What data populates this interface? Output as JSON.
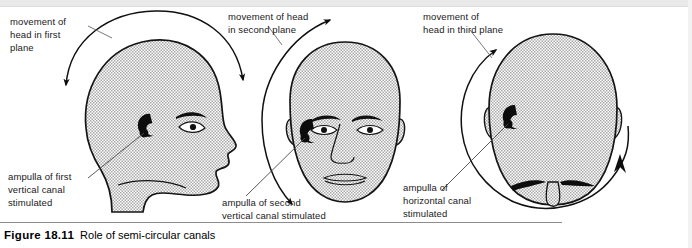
{
  "figure": {
    "number_label": "Figure 18.11",
    "caption_text": "Role of semi-circular canals",
    "panels": [
      {
        "id": "panel-first-plane",
        "view": "lateral-profile-head",
        "movement_label": "movement of\nhead in first\nplane",
        "ampulla_label": "ampulla of first\nvertical canal\nstimulated",
        "arrow_type": "double-headed-arc-over-top",
        "canal_symbol": "c-shaped-ampulla"
      },
      {
        "id": "panel-second-plane",
        "view": "frontal-head",
        "movement_label": "movement of head\nin second plane",
        "ampulla_label": "ampulla of second\nvertical canal stimulated",
        "arrow_type": "double-headed-arc-left-side",
        "canal_symbol": "c-shaped-ampulla"
      },
      {
        "id": "panel-third-plane",
        "view": "superior-top-of-head",
        "movement_label": "movement of\nhead in third plane",
        "ampulla_label": "ampulla of\nhorizontal canal\nstimulated",
        "arrow_type": "double-headed-arc-encircling",
        "canal_symbol": "c-shaped-ampulla"
      }
    ]
  },
  "colors": {
    "head_fill": "#d2d2d2",
    "outline": "#1a1a1a",
    "ink": "#000000",
    "page": "#ffffff",
    "rule": "#8d8d8d",
    "scan_band": "#e9e9e9"
  }
}
